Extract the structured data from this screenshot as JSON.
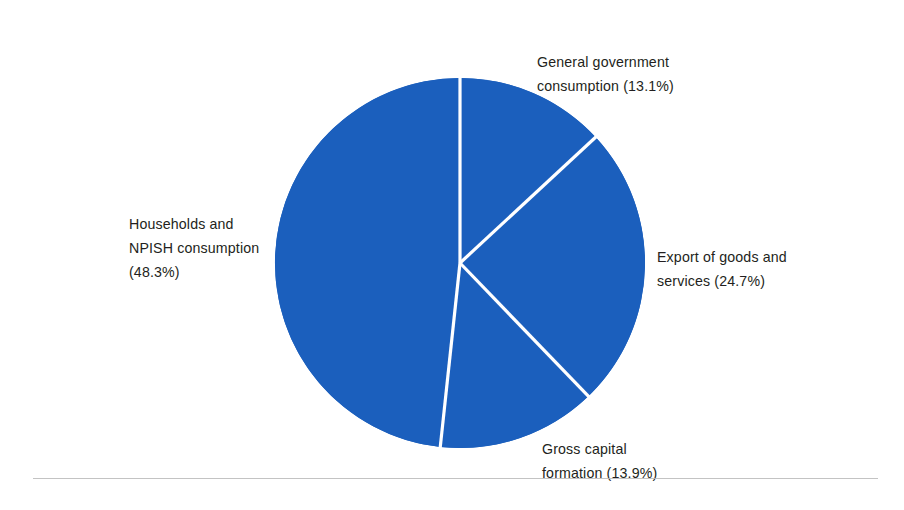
{
  "chart_data": {
    "type": "pie",
    "title": "",
    "subtitle": "",
    "xlabel": "",
    "ylabel": "",
    "legend_position": "outside-labels",
    "grid": false,
    "unit": "%",
    "start_angle_deg": 0,
    "direction": "clockwise",
    "slice_color": "#1b5fbd",
    "separator_color": "#ffffff",
    "categories": [
      "General government consumption",
      "Export of goods and services",
      "Gross capital formation",
      "Households and NPISH consumption"
    ],
    "values": [
      13.1,
      24.7,
      13.9,
      48.3
    ],
    "slices": [
      {
        "name": "General government consumption",
        "value": 13.1,
        "value_text": "(13.1%)",
        "color": "#1b5fbd",
        "label_lines": [
          "General government",
          "consumption (13.1%)"
        ]
      },
      {
        "name": "Export of goods and services",
        "value": 24.7,
        "value_text": "(24.7%)",
        "color": "#1b5fbd",
        "label_lines": [
          "Export of goods and",
          "services (24.7%)"
        ]
      },
      {
        "name": "Gross capital formation",
        "value": 13.9,
        "value_text": "(13.9%)",
        "color": "#1b5fbd",
        "label_lines": [
          "Gross capital",
          "formation (13.9%)"
        ]
      },
      {
        "name": "Households and NPISH consumption",
        "value": 48.3,
        "value_text": "(48.3%)",
        "color": "#1b5fbd",
        "label_lines": [
          "Households and",
          "NPISH consumption",
          "(48.3%)"
        ]
      }
    ]
  },
  "labels": {
    "gov": {
      "line1": "General government",
      "line2": "consumption (13.1%)"
    },
    "export": {
      "line1": "Export of goods and",
      "line2": "services (24.7%)"
    },
    "gross": {
      "line1": "Gross capital",
      "line2": "formation (13.9%)"
    },
    "households": {
      "line1": "Households and",
      "line2": "NPISH consumption",
      "line3": "(48.3%)"
    }
  },
  "colors": {
    "slice": "#1b5fbd",
    "separator": "#ffffff",
    "text": "#231f20",
    "rule": "#b9b9b9",
    "background": "#ffffff"
  }
}
